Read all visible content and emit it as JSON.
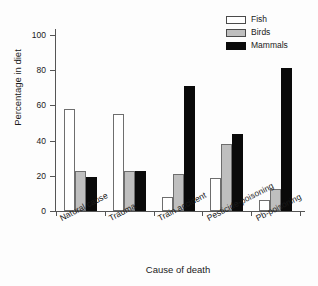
{
  "chart_data": {
    "type": "bar",
    "title": "",
    "xlabel": "Cause of death",
    "ylabel": "Percentage in diet",
    "categories": [
      "Natural cause",
      "Trauma",
      "Train accident",
      "Pesticide-poisoning",
      "Pb-poisoning"
    ],
    "series": [
      {
        "name": "Fish",
        "color": "#ffffff",
        "values": [
          58,
          55,
          8,
          19,
          6.5
        ]
      },
      {
        "name": "Birds",
        "color": "#bfbfbf",
        "values": [
          23,
          23,
          21,
          38,
          12.5
        ]
      },
      {
        "name": "Mammals",
        "color": "#0a0a0a",
        "values": [
          19.5,
          23,
          71,
          44,
          81
        ]
      }
    ],
    "ylim": [
      0,
      100
    ],
    "yticks": [
      0,
      20,
      40,
      60,
      80,
      100
    ],
    "ytick_labels": [
      "0",
      "20",
      "40",
      "60",
      "80",
      "100"
    ],
    "grid": false,
    "legend_position": "top-right",
    "legend_entries": [
      "Fish",
      "Birds",
      "Mammals"
    ]
  }
}
